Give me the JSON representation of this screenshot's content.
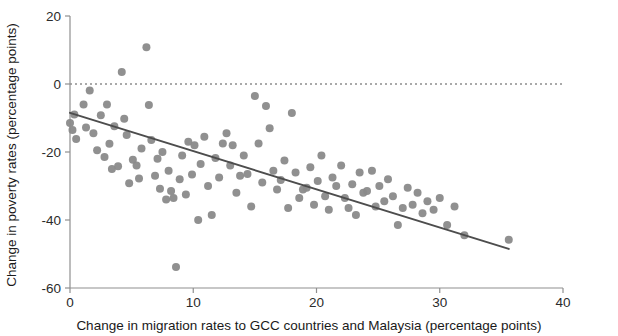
{
  "chart_data": {
    "type": "scatter",
    "title": "",
    "xlabel": "Change in migration rates to GCC countries and Malaysia (percentage points)",
    "ylabel": "Change in poverty rates (percentage points)",
    "xlim": [
      0,
      40
    ],
    "ylim": [
      -60,
      20
    ],
    "xticks": [
      0,
      10,
      20,
      30,
      40
    ],
    "yticks": [
      20,
      0,
      -20,
      -40,
      -60
    ],
    "xtick_labels": [
      "0",
      "10",
      "20",
      "30",
      "40"
    ],
    "ytick_labels": [
      "20",
      "0",
      "-20",
      "-40",
      "-60"
    ],
    "grid": false,
    "legend": "none",
    "marker": {
      "shape": "circle",
      "color": "#8a8a8a",
      "size_px": 8,
      "opacity": 0.95
    },
    "reference_line": {
      "kind": "horizontal-dashed",
      "y": 0,
      "color": "#555555",
      "dash": "2 3"
    },
    "trend_line": {
      "kind": "linear-fit",
      "color": "#4d4d4d",
      "width_px": 2,
      "x_start": 0,
      "y_start": -8.5,
      "x_end": 35.6,
      "y_end": -48.5,
      "slope": -1.124,
      "intercept": -8.5
    },
    "points": [
      [
        0.0,
        -11.5
      ],
      [
        0.2,
        -13.5
      ],
      [
        0.35,
        -9.0
      ],
      [
        0.5,
        -16.2
      ],
      [
        1.1,
        -6.0
      ],
      [
        1.3,
        -12.8
      ],
      [
        1.6,
        -1.9
      ],
      [
        1.9,
        -14.5
      ],
      [
        2.2,
        -19.5
      ],
      [
        2.5,
        -9.2
      ],
      [
        2.8,
        -21.5
      ],
      [
        3.0,
        -6.0
      ],
      [
        3.2,
        -17.6
      ],
      [
        3.4,
        -25.0
      ],
      [
        3.6,
        -12.4
      ],
      [
        3.9,
        -24.2
      ],
      [
        4.2,
        3.5
      ],
      [
        4.4,
        -10.2
      ],
      [
        4.6,
        -15.0
      ],
      [
        4.8,
        -29.2
      ],
      [
        5.1,
        -22.3
      ],
      [
        5.4,
        -24.0
      ],
      [
        5.6,
        -27.8
      ],
      [
        5.8,
        -19.0
      ],
      [
        6.2,
        10.8
      ],
      [
        6.4,
        -6.2
      ],
      [
        6.6,
        -16.5
      ],
      [
        6.9,
        -27.0
      ],
      [
        7.1,
        -22.0
      ],
      [
        7.3,
        -30.8
      ],
      [
        7.5,
        -20.0
      ],
      [
        7.8,
        -34.0
      ],
      [
        8.0,
        -25.5
      ],
      [
        8.2,
        -31.5
      ],
      [
        8.4,
        -33.5
      ],
      [
        8.6,
        -53.8
      ],
      [
        8.9,
        -28.0
      ],
      [
        9.1,
        -21.0
      ],
      [
        9.4,
        -32.5
      ],
      [
        9.6,
        -17.0
      ],
      [
        9.9,
        -26.6
      ],
      [
        10.1,
        -18.0
      ],
      [
        10.4,
        -40.0
      ],
      [
        10.6,
        -23.5
      ],
      [
        10.9,
        -15.5
      ],
      [
        11.2,
        -30.0
      ],
      [
        11.5,
        -38.5
      ],
      [
        11.8,
        -21.8
      ],
      [
        12.1,
        -27.5
      ],
      [
        12.4,
        -17.5
      ],
      [
        12.7,
        -14.5
      ],
      [
        13.0,
        -24.0
      ],
      [
        13.2,
        -18.0
      ],
      [
        13.5,
        -32.0
      ],
      [
        13.8,
        -27.0
      ],
      [
        14.1,
        -21.0
      ],
      [
        14.4,
        -26.5
      ],
      [
        14.7,
        -36.0
      ],
      [
        15.0,
        -3.5
      ],
      [
        15.3,
        -17.5
      ],
      [
        15.6,
        -29.0
      ],
      [
        15.9,
        -6.5
      ],
      [
        16.2,
        -13.0
      ],
      [
        16.5,
        -25.5
      ],
      [
        16.8,
        -31.0
      ],
      [
        17.1,
        -28.2
      ],
      [
        17.4,
        -22.5
      ],
      [
        17.7,
        -36.5
      ],
      [
        18.0,
        -8.5
      ],
      [
        18.3,
        -26.0
      ],
      [
        18.6,
        -33.5
      ],
      [
        18.9,
        -31.0
      ],
      [
        19.2,
        -30.5
      ],
      [
        19.5,
        -24.5
      ],
      [
        19.8,
        -35.5
      ],
      [
        20.1,
        -28.5
      ],
      [
        20.4,
        -21.0
      ],
      [
        20.7,
        -33.0
      ],
      [
        21.0,
        -37.0
      ],
      [
        21.3,
        -27.5
      ],
      [
        21.6,
        -30.0
      ],
      [
        22.0,
        -24.0
      ],
      [
        22.3,
        -33.5
      ],
      [
        22.6,
        -36.5
      ],
      [
        22.9,
        -29.5
      ],
      [
        23.2,
        -38.5
      ],
      [
        23.5,
        -26.0
      ],
      [
        23.8,
        -32.0
      ],
      [
        24.1,
        -31.5
      ],
      [
        24.5,
        -25.5
      ],
      [
        24.8,
        -36.0
      ],
      [
        25.1,
        -30.0
      ],
      [
        25.5,
        -34.5
      ],
      [
        25.8,
        -28.0
      ],
      [
        26.2,
        -33.0
      ],
      [
        26.6,
        -41.5
      ],
      [
        27.0,
        -36.5
      ],
      [
        27.4,
        -30.5
      ],
      [
        27.8,
        -35.5
      ],
      [
        28.2,
        -32.0
      ],
      [
        28.6,
        -38.0
      ],
      [
        29.0,
        -34.5
      ],
      [
        29.5,
        -37.0
      ],
      [
        30.0,
        -33.5
      ],
      [
        30.6,
        -41.5
      ],
      [
        31.2,
        -36.0
      ],
      [
        32.0,
        -44.5
      ],
      [
        35.6,
        -45.8
      ]
    ]
  },
  "axes": {
    "x_axis_name": "x-axis",
    "y_axis_name": "y-axis"
  }
}
